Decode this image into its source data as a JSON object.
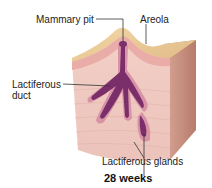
{
  "diagram": {
    "labels": {
      "mammary_pit": "Mammary pit",
      "areola": "Areola",
      "lactiferous_duct_line1": "Lactiferous",
      "lactiferous_duct_line2": "duct",
      "lactiferous_glands": "Lactiferous glands"
    },
    "caption": "28 weeks",
    "colors": {
      "skin_surface": "#e8c48e",
      "skin_front": "#e9b9ae",
      "dermis": "#f0c8c0",
      "side_face": "#c8917f",
      "duct": "#7a2f6a",
      "duct_outline": "#d48aa0",
      "leader_line": "#333333"
    }
  }
}
